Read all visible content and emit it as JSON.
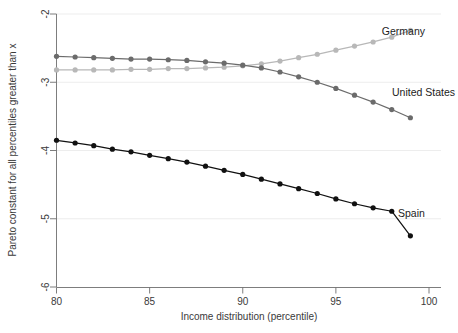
{
  "chart_data": {
    "type": "line",
    "title": "",
    "subtitle": "",
    "xlabel": "Income distribution (percentile)",
    "ylabel": "Pareto constant for all percentiles greater than x",
    "xlim": [
      80,
      100
    ],
    "ylim": [
      -6,
      -2
    ],
    "xticks": [
      80,
      85,
      90,
      95,
      100
    ],
    "xtick_labels": [
      "80",
      "85",
      "90",
      "95",
      "100"
    ],
    "yticks": [
      -2,
      -3,
      -4,
      -5,
      -6
    ],
    "ytick_labels": [
      "-2",
      "-3",
      "-4",
      "-5",
      "-6"
    ],
    "grid": true,
    "grid_axis": "y",
    "legend_position": "inline-annotations",
    "markers": true,
    "x": [
      80,
      81,
      82,
      83,
      84,
      85,
      86,
      87,
      88,
      89,
      90,
      91,
      92,
      93,
      94,
      95,
      96,
      97,
      98,
      99
    ],
    "series": [
      {
        "name": "Germany",
        "color": "#b8b8b8",
        "label_x": 99,
        "label_y": -2.24,
        "values": [
          -2.82,
          -2.82,
          -2.82,
          -2.82,
          -2.81,
          -2.81,
          -2.8,
          -2.8,
          -2.79,
          -2.78,
          -2.76,
          -2.73,
          -2.69,
          -2.64,
          -2.59,
          -2.53,
          -2.47,
          -2.41,
          -2.34,
          -2.24
        ]
      },
      {
        "name": "United States",
        "color": "#6b6b6b",
        "label_x": 99,
        "label_y": -3.52,
        "values": [
          -2.62,
          -2.63,
          -2.64,
          -2.65,
          -2.66,
          -2.66,
          -2.67,
          -2.68,
          -2.7,
          -2.72,
          -2.75,
          -2.79,
          -2.85,
          -2.92,
          -3.0,
          -3.09,
          -3.19,
          -3.29,
          -3.4,
          -3.52
        ]
      },
      {
        "name": "Spain",
        "color": "#111111",
        "label_x": 99,
        "label_y": -5.25,
        "values": [
          -3.85,
          -3.89,
          -3.93,
          -3.98,
          -4.02,
          -4.07,
          -4.12,
          -4.17,
          -4.23,
          -4.29,
          -4.35,
          -4.42,
          -4.49,
          -4.56,
          -4.63,
          -4.71,
          -4.78,
          -4.84,
          -4.89,
          -5.25
        ]
      }
    ],
    "annotations": [
      {
        "text": "Germany",
        "x": 425,
        "y": 35,
        "anchor": "end"
      },
      {
        "text": "United States",
        "x": 455,
        "y": 96,
        "anchor": "end"
      },
      {
        "text": "Spain",
        "x": 398,
        "y": 217,
        "anchor": "start"
      }
    ]
  }
}
